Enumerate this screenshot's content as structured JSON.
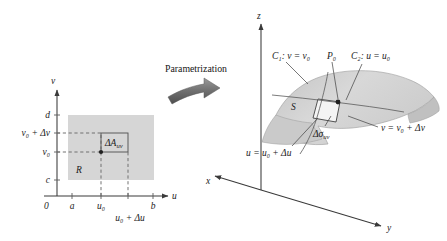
{
  "figure": {
    "title_caption": "Parametrization",
    "arrow_icon": "curved-right-arrow-icon",
    "background_color": "#ffffff",
    "region_fill_color": "#d6d6d6",
    "surface_fill_color": "#cfcfcf",
    "line_color": "#3a3a3a"
  },
  "left_panel": {
    "name": "uv-parameter-domain",
    "axes": {
      "vertical_label": "v",
      "horizontal_label": "u",
      "origin_label": "0"
    },
    "x_ticks": [
      {
        "label": "a"
      },
      {
        "label": "u",
        "sub": "0"
      },
      {
        "label": "u",
        "sub": "0",
        "suffix": " + Δu"
      },
      {
        "label": "b"
      }
    ],
    "x_tick_texts": [
      "a",
      "u₀",
      "u₀ + Δu",
      "b"
    ],
    "y_ticks": [
      {
        "label": "c"
      },
      {
        "label": "v",
        "sub": "0"
      },
      {
        "label": "v",
        "sub": "0",
        "suffix": " + Δv"
      },
      {
        "label": "d"
      }
    ],
    "y_tick_texts": [
      "c",
      "v₀",
      "v₀ + Δv",
      "d"
    ],
    "region_label": "R",
    "cell_label": "ΔA",
    "cell_label_sub": "uv",
    "point_name": "sample-point"
  },
  "right_panel": {
    "name": "surface-in-xyz-space",
    "axes": {
      "z_label": "z",
      "x_label": "x",
      "y_label": "y"
    },
    "surface_label": "S",
    "labels": [
      {
        "id": "curve-c1",
        "text": "C",
        "sub": "1",
        "rest": ": v = v",
        "rest_sub": "0"
      },
      {
        "id": "point-p0",
        "text": "P",
        "sub": "0",
        "rest": "",
        "rest_sub": ""
      },
      {
        "id": "curve-c2",
        "text": "C",
        "sub": "2",
        "rest": ": u = u",
        "rest_sub": "0"
      },
      {
        "id": "patch-area",
        "text": "Δσ",
        "sub": "uv",
        "rest": "",
        "rest_sub": ""
      },
      {
        "id": "curve-v-upper",
        "text": "v = v",
        "sub": "0",
        "rest": " + Δv",
        "rest_sub": ""
      },
      {
        "id": "curve-u-upper",
        "text": "u = u",
        "sub": "0",
        "rest": " + Δu",
        "rest_sub": ""
      }
    ],
    "label_texts": {
      "c1": "C₁: v = v₀",
      "p0": "P₀",
      "c2": "C₂: u = u₀",
      "dsigma": "Δσuv",
      "v_upper": "v = v₀ + Δv",
      "u_upper": "u = u₀ + Δu",
      "surface": "S"
    }
  }
}
